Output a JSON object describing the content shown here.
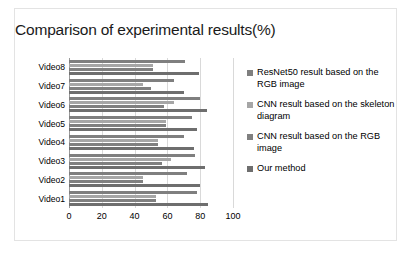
{
  "chart_data": {
    "type": "bar",
    "orientation": "horizontal",
    "title": "Comparison of experimental results(%)",
    "xlabel": "",
    "ylabel": "",
    "xlim": [
      0,
      100
    ],
    "xticks": [
      0,
      20,
      40,
      60,
      80,
      100
    ],
    "grid": true,
    "legend_position": "right",
    "categories": [
      "Video1",
      "Video2",
      "Video3",
      "Video4",
      "Video5",
      "Video6",
      "Video7",
      "Video8"
    ],
    "series": [
      {
        "name": "ResNet50 result based on the RGB image",
        "color": "#7f7f7f",
        "values": [
          78,
          72,
          77,
          70,
          75,
          80,
          64,
          71
        ]
      },
      {
        "name": "CNN result based on the skeleton diagram",
        "color": "#a6a6a6",
        "values": [
          53,
          45,
          62,
          54,
          59,
          64,
          45,
          51
        ]
      },
      {
        "name": "CNN result based on the RGB image",
        "color": "#808080",
        "values": [
          53,
          45,
          57,
          54,
          59,
          58,
          50,
          51
        ]
      },
      {
        "name": "Our method",
        "color": "#6e6e6e",
        "values": [
          85,
          80,
          83,
          76,
          78,
          84,
          70,
          79
        ]
      }
    ]
  },
  "legend": {
    "items": [
      {
        "label": "ResNet50 result based on the RGB image",
        "color": "#7f7f7f"
      },
      {
        "label": "CNN result based on the skeleton diagram",
        "color": "#a6a6a6"
      },
      {
        "label": "CNN result based on the RGB image",
        "color": "#808080"
      },
      {
        "label": "Our method",
        "color": "#6e6e6e"
      }
    ]
  }
}
